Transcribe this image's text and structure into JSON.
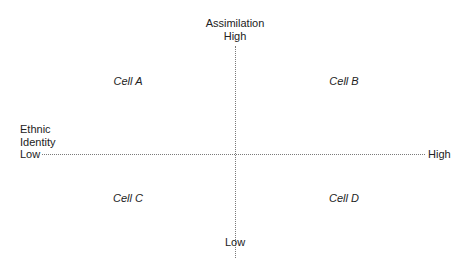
{
  "diagram": {
    "y_axis": {
      "title": "Assimilation",
      "high_label": "High",
      "low_label": "Low"
    },
    "x_axis": {
      "title_line1": "Ethnic",
      "title_line2": "Identity",
      "low_label": "Low",
      "high_label": "High"
    },
    "cells": {
      "top_left": "Cell A",
      "top_right": "Cell B",
      "bottom_left": "Cell C",
      "bottom_right": "Cell D"
    },
    "colors": {
      "text": "#222222",
      "axis_line": "#7a7a7a",
      "background": "#ffffff"
    }
  }
}
